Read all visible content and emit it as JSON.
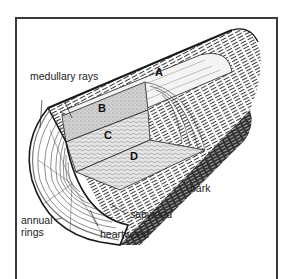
{
  "diagram": {
    "labels": {
      "medullary_rays": "medullary rays",
      "bark": "bark",
      "sapwood": "sapwood",
      "heartwood": "heartwood",
      "annual_rings_line1": "annual",
      "annual_rings_line2": "rings"
    },
    "letters": {
      "a": "A",
      "b": "B",
      "c": "C",
      "d": "D"
    },
    "colors": {
      "ink": "#1a1a1a",
      "frame": "#3a3a3a",
      "background": "#ffffff",
      "cut_face": "#d9d9d9"
    }
  }
}
